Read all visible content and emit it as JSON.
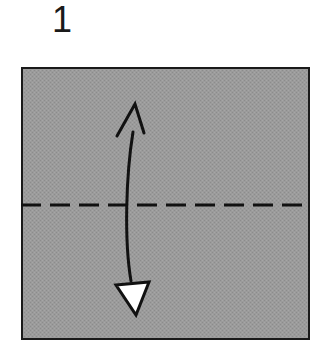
{
  "diagram": {
    "kind": "origami-fold-step",
    "step_number": "1",
    "canvas": {
      "width": 332,
      "height": 349,
      "background": "#ffffff"
    },
    "paper": {
      "name": "square-sheet",
      "shape": "square",
      "x": 21,
      "y": 67,
      "width": 289,
      "height": 273,
      "fill_color": "#999999",
      "fill_texture": "halftone-dither",
      "border_color": "#1a1a1a",
      "border_width": 2
    },
    "crease": {
      "name": "valley-fold-line",
      "style": "dashed",
      "orientation": "horizontal",
      "y": 205,
      "x_start": 21,
      "x_end": 310,
      "color": "#111111",
      "stroke_width": 3,
      "dash_length": 20,
      "gap_length": 9
    },
    "fold_arrow": {
      "name": "fold-direction-arrow",
      "description": "curved double-headed arrow indicating fold bottom edge up to top edge",
      "color": "#111111",
      "stroke_width": 3,
      "path": "M 131 281 C 124 240 126 175 133 132",
      "head_top": {
        "style": "open-v-barbs",
        "tip_x": 135,
        "tip_y": 104,
        "barb_left_x": 117,
        "barb_left_y": 136,
        "barb_right_x": 144,
        "barb_right_y": 133
      },
      "head_bottom": {
        "style": "hollow-filled-triangle",
        "fill_color": "#ffffff",
        "outline_color": "#111111",
        "vertices": [
          [
            116,
            285
          ],
          [
            149,
            282
          ],
          [
            136,
            315
          ]
        ]
      }
    }
  }
}
